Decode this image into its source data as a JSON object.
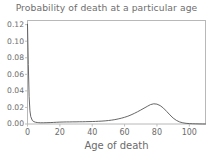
{
  "chart_data": {
    "type": "line",
    "title": "Probability of death at a particular age",
    "xlabel": "Age of death",
    "ylabel": "",
    "xlim": [
      0,
      110
    ],
    "ylim": [
      0.0,
      0.125
    ],
    "grid": false,
    "legend": null,
    "xticks": [
      "0",
      "20",
      "40",
      "60",
      "80",
      "100"
    ],
    "xtick_values": [
      0,
      20,
      40,
      60,
      80,
      100
    ],
    "yticks": [
      "0.00",
      "0.02",
      "0.04",
      "0.06",
      "0.08",
      "0.10",
      "0.12"
    ],
    "ytick_values": [
      0.0,
      0.02,
      0.04,
      0.06,
      0.08,
      0.1,
      0.12
    ],
    "line_color": "#555555",
    "series": [
      {
        "name": "Probability of death",
        "x": [
          0,
          0.5,
          1,
          1.5,
          2,
          3,
          4,
          5,
          6,
          7,
          8,
          9,
          10,
          12,
          14,
          16,
          18,
          20,
          22,
          24,
          26,
          28,
          30,
          32,
          34,
          36,
          38,
          40,
          42,
          44,
          46,
          48,
          50,
          52,
          54,
          56,
          58,
          60,
          62,
          64,
          66,
          68,
          70,
          72,
          74,
          76,
          78,
          80,
          82,
          84,
          86,
          88,
          90,
          92,
          94,
          96,
          98,
          100,
          102,
          104,
          106,
          108,
          110
        ],
        "values": [
          0.1205,
          0.072,
          0.033,
          0.016,
          0.009,
          0.0042,
          0.0028,
          0.0021,
          0.0018,
          0.0016,
          0.0015,
          0.0015,
          0.0015,
          0.0016,
          0.0017,
          0.0019,
          0.0021,
          0.0023,
          0.0024,
          0.0025,
          0.0025,
          0.0026,
          0.0026,
          0.0027,
          0.0027,
          0.0028,
          0.0029,
          0.003,
          0.0031,
          0.0033,
          0.0035,
          0.0038,
          0.0042,
          0.0047,
          0.0053,
          0.0061,
          0.007,
          0.0081,
          0.0094,
          0.011,
          0.0128,
          0.0148,
          0.0169,
          0.0191,
          0.0213,
          0.0234,
          0.0244,
          0.024,
          0.0222,
          0.0192,
          0.0152,
          0.011,
          0.0072,
          0.0044,
          0.0025,
          0.0014,
          0.0008,
          0.0005,
          0.0003,
          0.0002,
          0.0001,
          5e-05,
          0.0
        ]
      }
    ]
  },
  "axes": {
    "frame_color": "#b8b8b8"
  }
}
